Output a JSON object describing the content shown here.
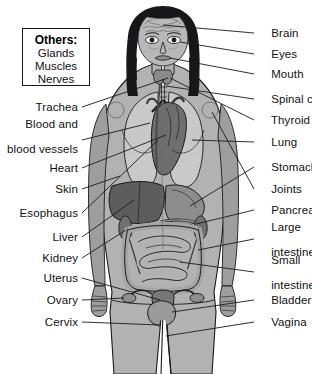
{
  "figure": {
    "background_color": "#ffffff",
    "line_color": "#1a1a1a",
    "text_color": "#111111"
  },
  "others_box": {
    "title": "Others:",
    "items": [
      "Glands",
      "Muscles",
      "Nerves"
    ],
    "border_color": "#1a1a1a"
  },
  "labels_left": [
    {
      "text": "Trachea",
      "y": 107,
      "lines": [
        "Trachea"
      ]
    },
    {
      "text": "Blood and blood vessels",
      "y": 136,
      "lines": [
        "Blood and",
        "blood vessels"
      ]
    },
    {
      "text": "Heart",
      "y": 168,
      "lines": [
        "Heart"
      ]
    },
    {
      "text": "Skin",
      "y": 189,
      "lines": [
        "Skin"
      ]
    },
    {
      "text": "Esophagus",
      "y": 213,
      "lines": [
        "Esophagus"
      ]
    },
    {
      "text": "Liver",
      "y": 237,
      "lines": [
        "Liver"
      ]
    },
    {
      "text": "Kidney",
      "y": 258,
      "lines": [
        "Kidney"
      ]
    },
    {
      "text": "Uterus",
      "y": 278,
      "lines": [
        "Uterus"
      ]
    },
    {
      "text": "Ovary",
      "y": 300,
      "lines": [
        "Ovary"
      ]
    },
    {
      "text": "Cervix",
      "y": 322,
      "lines": [
        "Cervix"
      ]
    }
  ],
  "labels_right": [
    {
      "text": "Brain",
      "y": 33,
      "lines": [
        "Brain"
      ]
    },
    {
      "text": "Eyes",
      "y": 54,
      "lines": [
        "Eyes"
      ]
    },
    {
      "text": "Mouth",
      "y": 74,
      "lines": [
        "Mouth"
      ]
    },
    {
      "text": "Spinal cord",
      "y": 99,
      "lines": [
        "Spinal cord"
      ]
    },
    {
      "text": "Thyroid",
      "y": 120,
      "lines": [
        "Thyroid"
      ]
    },
    {
      "text": "Lung",
      "y": 142,
      "lines": [
        "Lung"
      ]
    },
    {
      "text": "Stomach",
      "y": 167,
      "lines": [
        "Stomach"
      ]
    },
    {
      "text": "Joints",
      "y": 189,
      "lines": [
        "Joints"
      ]
    },
    {
      "text": "Pancreas",
      "y": 210,
      "lines": [
        "Pancreas"
      ]
    },
    {
      "text": "Large intestine",
      "y": 239,
      "lines": [
        "Large",
        "intestine"
      ]
    },
    {
      "text": "Small intestine",
      "y": 272,
      "lines": [
        "Small",
        "intestine"
      ]
    },
    {
      "text": "Bladder",
      "y": 300,
      "lines": [
        "Bladder"
      ]
    },
    {
      "text": "Vagina",
      "y": 322,
      "lines": [
        "Vagina"
      ]
    }
  ],
  "colors": {
    "skin": "#b2b2b2",
    "skin_shadow": "#9b9b9b",
    "hair": "#17171a",
    "lung": "#c9c9c9",
    "heart": "#6e6e6e",
    "liver": "#5d5d5d",
    "stomach": "#8d8d8d",
    "intestine": "#a5a5a5",
    "uterus": "#777777",
    "bladder": "#9a9a9a",
    "outline": "#1a1a1a"
  }
}
